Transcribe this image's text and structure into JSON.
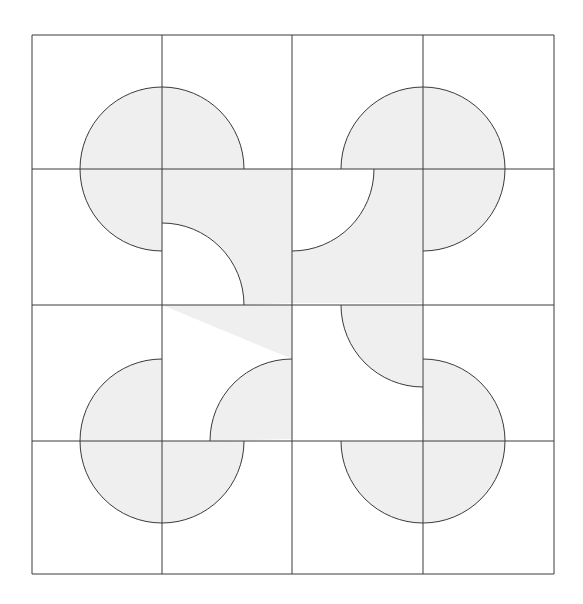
{
  "diagram": {
    "title": "",
    "type": "tiled quarter-circle pattern on 4x4 grid",
    "colors": {
      "background": "#ffffff",
      "fill": "#efefef",
      "stroke": "#3a3a3a"
    },
    "grid": {
      "rows": 4,
      "cols": 4,
      "x_lines": [
        32,
        162,
        292,
        423,
        554
      ],
      "y_lines": [
        35,
        169,
        305,
        441,
        574
      ]
    },
    "radius": 82,
    "circles": [
      {
        "name": "top-left-disc",
        "cx": 162,
        "cy": 169,
        "missing_quadrant": "bottom-right"
      },
      {
        "name": "top-right-disc",
        "cx": 423,
        "cy": 169,
        "missing_quadrant": "bottom-left"
      },
      {
        "name": "bottom-left-disc",
        "cx": 162,
        "cy": 441,
        "missing_quadrant": "top-right"
      },
      {
        "name": "bottom-right-disc",
        "cx": 423,
        "cy": 441,
        "missing_quadrant": "top-left"
      }
    ],
    "center_tiles": [
      {
        "name": "tile-r2c2",
        "x": 162,
        "y": 169,
        "cutout_cx": 162,
        "cutout_cy": 305
      },
      {
        "name": "tile-r2c3",
        "x": 292,
        "y": 169,
        "cutout_cx": 292,
        "cutout_cy": 169
      },
      {
        "name": "tile-r3c2",
        "x": 162,
        "y": 305,
        "cutout_cx": 292,
        "cutout_cy": 441
      },
      {
        "name": "tile-r3c3",
        "x": 292,
        "y": 305,
        "cutout_cx": 423,
        "cutout_cy": 305
      }
    ]
  }
}
